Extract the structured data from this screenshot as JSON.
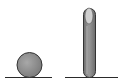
{
  "diagram": {
    "colors": {
      "background": "#ffffff",
      "line": "#2a2a2a",
      "sphere_fill": "#8c8c8c",
      "sphere_highlight": "#b5b5b5",
      "outline": "#333333",
      "capsule_body": "#8a8a8a",
      "capsule_tip": "#cfcfcf"
    },
    "objects": [
      {
        "name": "sphere",
        "cx": 29.5,
        "cy": 65,
        "r": 12.5
      },
      {
        "name": "capsule",
        "x": 83,
        "y": 8,
        "width": 13,
        "height": 70
      }
    ],
    "lines": [
      {
        "name": "left-ground",
        "x1": 5,
        "x2": 52,
        "y": 77.5
      },
      {
        "name": "right-ground",
        "x1": 65,
        "x2": 118,
        "y": 77.5
      }
    ]
  }
}
